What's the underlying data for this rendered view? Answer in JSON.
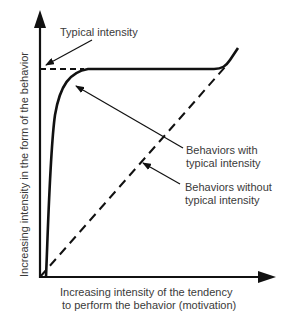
{
  "diagram": {
    "type": "conceptual-curve",
    "x_axis": {
      "label_line1": "Increasing intensity of the tendency",
      "label_line2": "to perform the behavior  (motivation)"
    },
    "y_axis": {
      "label": "Increasing intensity in the form of the behavior"
    },
    "annotations": {
      "typical_intensity": "Typical intensity",
      "with_line1": "Behaviors with",
      "with_line2": "typical intensity",
      "without_line1": "Behaviors without",
      "without_line2": "typical intensity"
    },
    "series": [
      {
        "name": "Behaviors with typical intensity",
        "style": "solid",
        "shape": "rapid rise then plateau at typical intensity, upturn at high motivation"
      },
      {
        "name": "Behaviors without typical intensity",
        "style": "dashed",
        "shape": "linear increase"
      }
    ],
    "colors": {
      "line": "#111111",
      "text": "#3a3a3a",
      "background": "#ffffff"
    }
  }
}
